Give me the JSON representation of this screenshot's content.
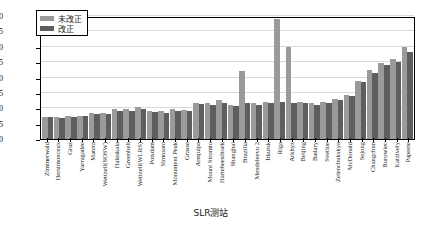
{
  "chart_data": {
    "type": "bar",
    "title": "",
    "xlabel": "SLR测站",
    "ylabel": "残差/mm",
    "ylim": [
      0,
      40
    ],
    "yticks": [
      0,
      5,
      10,
      15,
      20,
      25,
      30,
      35,
      40
    ],
    "grid": true,
    "legend_position": "top-left",
    "categories": [
      "Zimmerwald",
      "Herstmonceux",
      "Graz",
      "Yarragadee",
      "Matera",
      "Wettzell(SOSW)",
      "Haleakala",
      "Greenbelt",
      "Wettzell(WLRS)",
      "Potsdam",
      "Simosato",
      "Monument Peak",
      "Grasse",
      "Arequipa",
      "Mount Stromlo",
      "Hartebeesthoek",
      "Shanghai",
      "Brazilia",
      "Mendeleevo 2",
      "Irkutsk",
      "Riga",
      "Arkhyz",
      "Beijing",
      "Badary",
      "Svetloe",
      "Zelenchukskya",
      "McDonald",
      "Sejong",
      "Changchun",
      "Borowiec",
      "Katzively",
      "Papeete"
    ],
    "series": [
      {
        "name": "未改正",
        "color": "#9a9a9a",
        "values": [
          7.2,
          7.0,
          7.4,
          7.6,
          8.4,
          8.6,
          9.6,
          9.8,
          10.4,
          9.2,
          9.0,
          9.6,
          9.4,
          11.8,
          11.6,
          12.6,
          11.2,
          22.0,
          11.6,
          12.0,
          39.0,
          30.0,
          12.0,
          11.6,
          12.2,
          13.0,
          14.4,
          19.0,
          22.4,
          24.6,
          26.0,
          29.8
        ]
      },
      {
        "name": "改正",
        "color": "#5e5e5e",
        "values": [
          7.0,
          6.8,
          7.2,
          7.4,
          8.0,
          8.2,
          9.2,
          9.0,
          9.8,
          8.8,
          8.6,
          9.2,
          9.0,
          11.4,
          11.0,
          11.8,
          10.8,
          11.8,
          11.0,
          11.6,
          12.0,
          11.6,
          11.6,
          11.0,
          11.8,
          12.6,
          14.0,
          18.4,
          21.6,
          24.0,
          25.2,
          28.2
        ]
      }
    ]
  },
  "legend": {
    "items": [
      {
        "label": "未改正"
      },
      {
        "label": "改正"
      }
    ]
  },
  "caption": ""
}
